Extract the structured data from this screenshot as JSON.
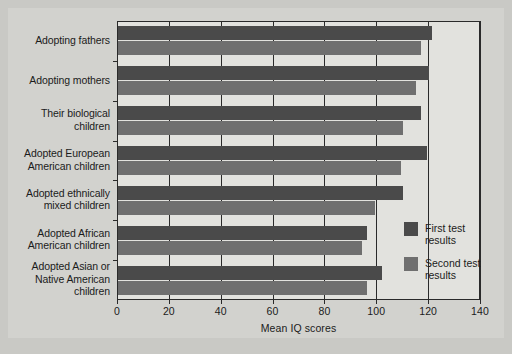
{
  "chart_data": {
    "type": "bar",
    "orientation": "horizontal",
    "title": "",
    "xlabel": "Mean IQ scores",
    "ylabel": "",
    "xlim": [
      0,
      140
    ],
    "xticks": [
      0,
      20,
      40,
      60,
      80,
      100,
      120,
      140
    ],
    "grid": true,
    "grid_axis": "x",
    "legend_position": "inside-right",
    "categories": [
      "Adopting fathers",
      "Adopting mothers",
      "Their biological children",
      "Adopted European American children",
      "Adopted ethnically mixed children",
      "Adopted African American children",
      "Adopted Asian or Native American children"
    ],
    "category_lines": [
      [
        "Adopting fathers"
      ],
      [
        "Adopting mothers"
      ],
      [
        "Their biological",
        "children"
      ],
      [
        "Adopted European",
        "American children"
      ],
      [
        "Adopted ethnically",
        "mixed children"
      ],
      [
        "Adopted African",
        "American children"
      ],
      [
        "Adopted Asian or",
        "Native American",
        "children"
      ]
    ],
    "series": [
      {
        "name": "First test results",
        "color": "#4a4a4a",
        "values": [
          121,
          120,
          117,
          119,
          110,
          96,
          102
        ]
      },
      {
        "name": "Second test results",
        "color": "#6f6f6f",
        "values": [
          117,
          115,
          110,
          109,
          99,
          94,
          96
        ]
      }
    ]
  },
  "legend": {
    "entries": [
      {
        "label_lines": [
          "First test",
          "results"
        ],
        "swatch": "first"
      },
      {
        "label_lines": [
          "Second test",
          "results"
        ],
        "swatch": "second"
      }
    ]
  },
  "colors": {
    "background": "#c9c9c5",
    "plate": "#d2d2ce",
    "plot_area": "#e2e2de",
    "axis": "#2a2a2a",
    "first_series": "#4a4a4a",
    "second_series": "#6f6f6f",
    "text": "#1b1b1b"
  }
}
